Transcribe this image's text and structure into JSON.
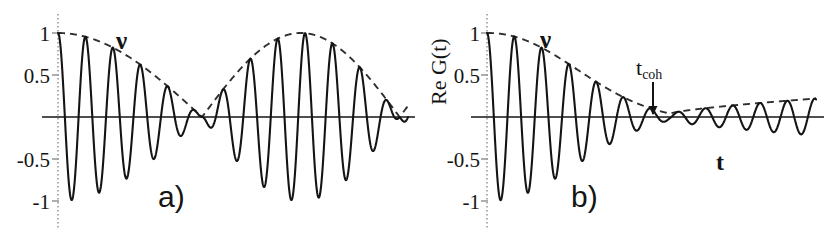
{
  "figure": {
    "background_color": "#ffffff",
    "curve_color": "#141414",
    "envelope_color": "#303030",
    "axis_color": "#9a9a9a",
    "baseline_color": "#141414"
  },
  "panels": [
    {
      "id": "a",
      "label": "a)",
      "label_pos": {
        "x": 158,
        "y": 182
      },
      "origin": {
        "x": 58,
        "y": 117
      },
      "x_end": 408,
      "unit_y_px": 84,
      "y_ticks": [
        {
          "value": 1,
          "text": "1"
        },
        {
          "value": 0.5,
          "text": "0.5"
        },
        {
          "value": -0.5,
          "text": "-0.5"
        },
        {
          "value": -1,
          "text": "-1"
        }
      ],
      "envelope_label": {
        "text": "ν",
        "x": 116,
        "y": 28
      },
      "x_axis_label": null,
      "y_axis_label": null,
      "annotation": null,
      "chart_ref": 0
    },
    {
      "id": "b",
      "label": "b)",
      "label_pos": {
        "x": 157,
        "y": 182
      },
      "origin": {
        "x": 73,
        "y": 117
      },
      "x_end": 402,
      "unit_y_px": 84,
      "y_ticks": [
        {
          "value": 1,
          "text": "1"
        },
        {
          "value": 0.5,
          "text": "0.5"
        },
        {
          "value": -0.5,
          "text": "-0.5"
        },
        {
          "value": -1,
          "text": "-1"
        }
      ],
      "envelope_label": {
        "text": "ν",
        "x": 126,
        "y": 27
      },
      "x_axis_label": {
        "text": "t",
        "x": 302,
        "y": 150
      },
      "y_axis_label": {
        "text": "Re G(t)",
        "x": 14,
        "y": 105
      },
      "annotation": {
        "text_main": "t",
        "text_sub": "coh",
        "x": 222,
        "y": 57,
        "arrow_x": 239,
        "arrow_y_top": 82,
        "arrow_y_bottom": 114
      },
      "chart_ref": 1
    }
  ],
  "chart_data": [
    {
      "type": "line",
      "title": "a)",
      "xlabel": "",
      "ylabel": "",
      "ylim": [
        -1.15,
        1.15
      ],
      "xlim": [
        0,
        4.18
      ],
      "grid": false,
      "legend": false,
      "annotations": [
        "ν"
      ],
      "description": "Collapse-and-revival oscillation: fast cosine carrier modulated by an absolute-cosine envelope with nodes at t=1.72 and t=4.08.",
      "series": [
        {
          "name": "Re G(t) carrier",
          "style": "solid",
          "formula": "cos(2*pi*f*t) * envelope(t)",
          "carrier_frequency_cycles_per_unit": 3.05,
          "carrier_phase": 0.0
        },
        {
          "name": "envelope ν",
          "style": "dashed",
          "formula": "abs(cos(pi*(t-0)/ (2*1.72))) shaped: |cos(pi*t/3.44)| with revival peak 1.0 at t=3.44",
          "nodes": [
            1.72,
            4.08
          ],
          "peaks": [
            {
              "x": 0.0,
              "y": 1.0
            },
            {
              "x": 3.0,
              "y": 1.0
            }
          ]
        }
      ],
      "y_ticks": [
        1,
        0.5,
        -0.5,
        -1
      ],
      "y_tick_labels": [
        "1",
        "0.5",
        "-0.5",
        "-1"
      ]
    },
    {
      "type": "line",
      "title": "b)",
      "xlabel": "t",
      "ylabel": "Re G(t)",
      "ylim": [
        -1.15,
        1.15
      ],
      "xlim": [
        0,
        3.95
      ],
      "grid": false,
      "legend": false,
      "annotations": [
        "ν",
        "t_coh"
      ],
      "description": "Damped oscillation: fast cosine carrier under a Gaussian-like decaying envelope that reaches a minimum at the coherence time t_coh and then slowly recovers.",
      "series": [
        {
          "name": "Re G(t) carrier",
          "style": "solid",
          "formula": "cos(2*pi*f*t) * envelope(t)",
          "carrier_frequency_cycles_per_unit": 3.05,
          "carrier_phase": 0.0
        },
        {
          "name": "envelope ν",
          "style": "dashed",
          "formula": "gaussian decay exp(-(t/1.62)^2) down to ~0.04 at t_coh, then linear recovery to ~0.22",
          "t_coh": 2.2,
          "min_value_at_t_coh": 0.04,
          "peaks": [
            {
              "x": 0.0,
              "y": 1.0
            },
            {
              "x": 3.95,
              "y": 0.22
            }
          ]
        }
      ],
      "y_ticks": [
        1,
        0.5,
        -0.5,
        -1
      ],
      "y_tick_labels": [
        "1",
        "0.5",
        "-0.5",
        "-1"
      ]
    }
  ]
}
